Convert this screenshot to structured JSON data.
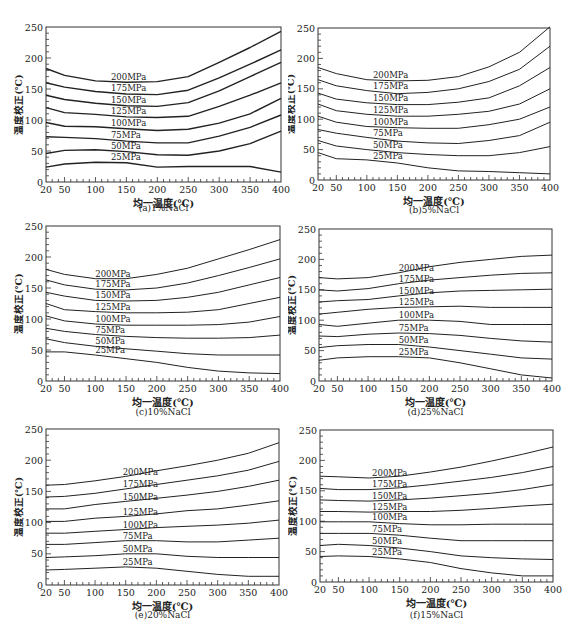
{
  "chart_data": [
    {
      "type": "line",
      "panel": "a",
      "title": "",
      "caption": "(a)1%NaCl",
      "xlabel": "均一温度(℃)",
      "ylabel": "温度校正(℃)",
      "xlim": [
        20,
        400
      ],
      "ylim": [
        0,
        250
      ],
      "xticks": [
        20,
        50,
        100,
        150,
        200,
        250,
        300,
        350,
        400
      ],
      "yticks": [
        0,
        50,
        100,
        150,
        200,
        250
      ],
      "grid": false,
      "legend_position": "inline labels",
      "x": [
        20,
        50,
        100,
        150,
        200,
        250,
        300,
        350,
        400
      ],
      "series": [
        {
          "name": "200MPa",
          "values": [
            183,
            172,
            163,
            161,
            162,
            170,
            193,
            217,
            243
          ]
        },
        {
          "name": "175MPa",
          "values": [
            160,
            153,
            146,
            142,
            141,
            148,
            168,
            190,
            213
          ]
        },
        {
          "name": "150MPa",
          "values": [
            140,
            133,
            127,
            123,
            122,
            128,
            147,
            170,
            193
          ]
        },
        {
          "name": "125MPa",
          "values": [
            120,
            112,
            109,
            105,
            104,
            106,
            122,
            140,
            160
          ]
        },
        {
          "name": "100MPa",
          "values": [
            96,
            90,
            89,
            86,
            83,
            85,
            95,
            110,
            135
          ]
        },
        {
          "name": "75MPa",
          "values": [
            73,
            72,
            70,
            66,
            63,
            63,
            74,
            88,
            108
          ]
        },
        {
          "name": "50MPa",
          "values": [
            46,
            51,
            52,
            49,
            44,
            43,
            50,
            62,
            82
          ]
        },
        {
          "name": "25MPa",
          "values": [
            24,
            29,
            32,
            31,
            24,
            25,
            25,
            25,
            16
          ]
        }
      ]
    },
    {
      "type": "line",
      "panel": "b",
      "title": "",
      "caption": "(b)5%NaCl",
      "xlabel": "均一温度(℃)",
      "ylabel": "温度校正(℃)",
      "xlim": [
        20,
        400
      ],
      "ylim": [
        0,
        250
      ],
      "xticks": [
        20,
        50,
        100,
        150,
        200,
        250,
        300,
        350,
        400
      ],
      "yticks": [
        0,
        50,
        100,
        150,
        200,
        250
      ],
      "grid": false,
      "legend_position": "inline labels",
      "x": [
        20,
        50,
        100,
        150,
        200,
        250,
        300,
        350,
        400
      ],
      "series": [
        {
          "name": "200MPa",
          "values": [
            185,
            175,
            165,
            163,
            164,
            170,
            186,
            210,
            252
          ]
        },
        {
          "name": "175MPa",
          "values": [
            165,
            155,
            147,
            142,
            144,
            150,
            162,
            182,
            220
          ]
        },
        {
          "name": "150MPa",
          "values": [
            143,
            133,
            127,
            124,
            124,
            128,
            135,
            155,
            185
          ]
        },
        {
          "name": "125MPa",
          "values": [
            125,
            114,
            108,
            105,
            105,
            108,
            113,
            125,
            150
          ]
        },
        {
          "name": "100MPa",
          "values": [
            105,
            95,
            88,
            86,
            85,
            85,
            91,
            100,
            120
          ]
        },
        {
          "name": "75MPa",
          "values": [
            83,
            77,
            70,
            64,
            61,
            60,
            65,
            73,
            95
          ]
        },
        {
          "name": "50MPa",
          "values": [
            65,
            56,
            50,
            45,
            42,
            40,
            40,
            45,
            55
          ]
        },
        {
          "name": "25MPa",
          "values": [
            45,
            35,
            33,
            28,
            20,
            15,
            14,
            12,
            10
          ]
        }
      ]
    },
    {
      "type": "line",
      "panel": "c",
      "title": "",
      "caption": "(c)10%NaCl",
      "xlabel": "均一温度(℃)",
      "ylabel": "温度校正(℃)",
      "xlim": [
        20,
        400
      ],
      "ylim": [
        0,
        250
      ],
      "xticks": [
        20,
        50,
        100,
        150,
        200,
        250,
        300,
        350,
        400
      ],
      "yticks": [
        0,
        50,
        100,
        150,
        200,
        250
      ],
      "grid": false,
      "legend_position": "inline labels",
      "x": [
        20,
        50,
        100,
        150,
        200,
        250,
        300,
        350,
        400
      ],
      "series": [
        {
          "name": "200MPa",
          "values": [
            180,
            172,
            165,
            165,
            172,
            182,
            197,
            212,
            228
          ]
        },
        {
          "name": "175MPa",
          "values": [
            163,
            155,
            148,
            147,
            150,
            158,
            170,
            183,
            197
          ]
        },
        {
          "name": "150MPa",
          "values": [
            143,
            137,
            130,
            129,
            130,
            135,
            143,
            155,
            167
          ]
        },
        {
          "name": "125MPa",
          "values": [
            125,
            115,
            112,
            110,
            110,
            111,
            115,
            125,
            135
          ]
        },
        {
          "name": "100MPa",
          "values": [
            105,
            97,
            92,
            90,
            90,
            90,
            91,
            95,
            104
          ]
        },
        {
          "name": "75MPa",
          "values": [
            85,
            80,
            75,
            72,
            70,
            69,
            69,
            70,
            74
          ]
        },
        {
          "name": "50MPa",
          "values": [
            68,
            62,
            56,
            52,
            48,
            44,
            42,
            42,
            42
          ]
        },
        {
          "name": "25MPa",
          "values": [
            47,
            47,
            42,
            36,
            30,
            22,
            16,
            13,
            12
          ]
        }
      ]
    },
    {
      "type": "line",
      "panel": "d",
      "title": "",
      "caption": "(d)25%NaCl",
      "xlabel": "均一温度(℃)",
      "ylabel": "温度校正(℃)",
      "xlim": [
        20,
        400
      ],
      "ylim": [
        0,
        250
      ],
      "xticks": [
        20,
        50,
        100,
        150,
        200,
        250,
        300,
        350,
        400
      ],
      "yticks": [
        0,
        50,
        100,
        150,
        200,
        250
      ],
      "grid": false,
      "legend_position": "inline labels",
      "x": [
        20,
        50,
        100,
        150,
        200,
        250,
        300,
        350,
        400
      ],
      "series": [
        {
          "name": "200MPa",
          "values": [
            170,
            168,
            170,
            178,
            188,
            195,
            200,
            205,
            207
          ]
        },
        {
          "name": "175MPa",
          "values": [
            150,
            148,
            152,
            160,
            166,
            170,
            174,
            177,
            178
          ]
        },
        {
          "name": "150MPa",
          "values": [
            130,
            132,
            134,
            140,
            145,
            148,
            149,
            150,
            151
          ]
        },
        {
          "name": "125MPa",
          "values": [
            110,
            113,
            118,
            121,
            122,
            123,
            121,
            121,
            121
          ]
        },
        {
          "name": "100MPa",
          "values": [
            93,
            90,
            95,
            100,
            100,
            98,
            93,
            93,
            93
          ]
        },
        {
          "name": "75MPa",
          "values": [
            74,
            73,
            77,
            79,
            78,
            75,
            70,
            66,
            64
          ]
        },
        {
          "name": "50MPa",
          "values": [
            55,
            58,
            60,
            60,
            56,
            50,
            44,
            38,
            36
          ]
        },
        {
          "name": "25MPa",
          "values": [
            34,
            38,
            40,
            40,
            38,
            30,
            20,
            10,
            5
          ]
        }
      ]
    },
    {
      "type": "line",
      "panel": "e",
      "title": "",
      "caption": "(e)20%NaCl",
      "xlabel": "均一温度(℃)",
      "ylabel": "温度校正(℃)",
      "xlim": [
        20,
        400
      ],
      "ylim": [
        0,
        250
      ],
      "xticks": [
        20,
        50,
        100,
        150,
        200,
        250,
        300,
        350,
        400
      ],
      "yticks": [
        0,
        50,
        100,
        150,
        200,
        250
      ],
      "grid": false,
      "legend_position": "inline labels",
      "x": [
        20,
        50,
        100,
        150,
        200,
        250,
        300,
        350,
        400
      ],
      "series": [
        {
          "name": "200MPa",
          "values": [
            160,
            161,
            167,
            174,
            183,
            191,
            200,
            211,
            228
          ]
        },
        {
          "name": "175MPa",
          "values": [
            141,
            142,
            147,
            154,
            161,
            168,
            175,
            184,
            198
          ]
        },
        {
          "name": "150MPa",
          "values": [
            122,
            122,
            129,
            134,
            139,
            144,
            150,
            158,
            168
          ]
        },
        {
          "name": "125MPa",
          "values": [
            102,
            102,
            107,
            110,
            114,
            119,
            122,
            128,
            135
          ]
        },
        {
          "name": "100MPa",
          "values": [
            83,
            83,
            86,
            89,
            92,
            94,
            96,
            99,
            104
          ]
        },
        {
          "name": "75MPa",
          "values": [
            65,
            65,
            68,
            71,
            71,
            69,
            69,
            72,
            75
          ]
        },
        {
          "name": "50MPa",
          "values": [
            44,
            45,
            47,
            50,
            50,
            46,
            44,
            44,
            44
          ]
        },
        {
          "name": "25MPa",
          "values": [
            24,
            25,
            27,
            29,
            27,
            22,
            17,
            14,
            14
          ]
        }
      ]
    },
    {
      "type": "line",
      "panel": "f",
      "title": "",
      "caption": "(f)15%NaCl",
      "xlabel": "均一温度(℃)",
      "ylabel": "温度校正(℃)",
      "xlim": [
        20,
        400
      ],
      "ylim": [
        0,
        250
      ],
      "xticks": [
        20,
        50,
        100,
        150,
        200,
        250,
        300,
        350,
        400
      ],
      "yticks": [
        0,
        50,
        100,
        150,
        200,
        250
      ],
      "grid": false,
      "legend_position": "inline labels",
      "x": [
        20,
        50,
        100,
        150,
        200,
        250,
        300,
        350,
        400
      ],
      "series": [
        {
          "name": "200MPa",
          "values": [
            174,
            173,
            171,
            174,
            181,
            189,
            199,
            210,
            222
          ]
        },
        {
          "name": "175MPa",
          "values": [
            154,
            152,
            152,
            155,
            160,
            166,
            172,
            180,
            190
          ]
        },
        {
          "name": "150MPa",
          "values": [
            135,
            134,
            133,
            135,
            138,
            142,
            146,
            152,
            160
          ]
        },
        {
          "name": "125MPa",
          "values": [
            116,
            116,
            115,
            116,
            116,
            118,
            121,
            125,
            128
          ]
        },
        {
          "name": "100MPa",
          "values": [
            99,
            99,
            99,
            96,
            94,
            94,
            95,
            95,
            95
          ]
        },
        {
          "name": "75MPa",
          "values": [
            80,
            80,
            80,
            77,
            72,
            68,
            68,
            68,
            68
          ]
        },
        {
          "name": "50MPa",
          "values": [
            60,
            62,
            60,
            56,
            50,
            43,
            40,
            38,
            37
          ]
        },
        {
          "name": "25MPa",
          "values": [
            42,
            43,
            42,
            38,
            32,
            22,
            15,
            10,
            10
          ]
        }
      ]
    }
  ]
}
